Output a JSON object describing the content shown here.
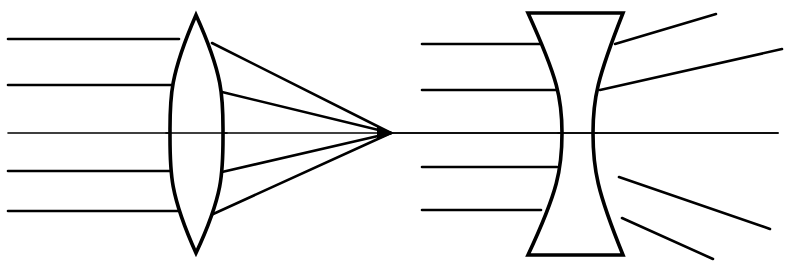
{
  "figure": {
    "width": 785,
    "height": 267,
    "background_color": "#ffffff",
    "stroke_color": "#000000",
    "lens_fill": "#ffffff"
  },
  "optical_axis": {
    "name": "optical-axis",
    "y": 133,
    "x_start": 8,
    "x_end": 778,
    "stroke_width": 1.6
  },
  "focal_point": {
    "name": "focal-point",
    "x": 391,
    "y": 133,
    "marker": "arrowhead-convergence"
  },
  "converging_lens": {
    "name": "biconvex-lens",
    "type": "biconvex",
    "top_vertex": {
      "x": 196,
      "y": 15
    },
    "bottom_vertex": {
      "x": 196,
      "y": 253
    },
    "left_bulge_x": 170,
    "right_bulge_x": 223,
    "axis_y": 133,
    "stroke_width": 3.6
  },
  "diverging_lens": {
    "name": "biconcave-lens",
    "type": "biconcave",
    "top_left": {
      "x": 528,
      "y": 13
    },
    "top_right": {
      "x": 623,
      "y": 13
    },
    "bottom_left": {
      "x": 528,
      "y": 255
    },
    "bottom_right": {
      "x": 623,
      "y": 255
    },
    "waist_left_x": 562,
    "waist_right_x": 593,
    "axis_y": 133,
    "stroke_width": 3.6
  },
  "incident_rays_left": {
    "name": "incident-parallel-rays-left",
    "count": 5,
    "x_start": 8,
    "stroke_width": 2.6,
    "rays": [
      {
        "label": "ray-1",
        "y": 39,
        "x_end": 179
      },
      {
        "label": "ray-2",
        "y": 85,
        "x_end": 172
      },
      {
        "label": "ray-3",
        "y": 133,
        "x_end": 170
      },
      {
        "label": "ray-4",
        "y": 171,
        "x_end": 172
      },
      {
        "label": "ray-5",
        "y": 211,
        "x_end": 178
      }
    ]
  },
  "refracted_rays_converging": {
    "name": "converging-refracted-rays",
    "count": 4,
    "converge_at": {
      "x": 391,
      "y": 133
    },
    "stroke_width": 2.6,
    "rays": [
      {
        "label": "conv-ray-1",
        "x_start": 212,
        "y_start": 43
      },
      {
        "label": "conv-ray-2",
        "x_start": 222,
        "y_start": 92
      },
      {
        "label": "conv-ray-3",
        "x_start": 222,
        "y_start": 172
      },
      {
        "label": "conv-ray-4",
        "x_start": 211,
        "y_start": 215
      }
    ]
  },
  "incident_rays_right": {
    "name": "incident-parallel-rays-right",
    "count": 5,
    "x_start": 422,
    "stroke_width": 2.6,
    "rays": [
      {
        "label": "ray-6",
        "y": 44,
        "x_end": 540
      },
      {
        "label": "ray-7",
        "y": 90,
        "x_end": 557
      },
      {
        "label": "ray-8",
        "y": 133,
        "x_end": 562
      },
      {
        "label": "ray-9",
        "y": 167,
        "x_end": 557
      },
      {
        "label": "ray-10",
        "y": 210,
        "x_end": 541
      }
    ]
  },
  "refracted_rays_diverging": {
    "name": "diverging-refracted-rays",
    "count": 4,
    "stroke_width": 2.6,
    "rays": [
      {
        "label": "div-ray-1",
        "x_start": 615,
        "y_start": 44,
        "x_end": 716,
        "y_end": 14
      },
      {
        "label": "div-ray-2",
        "x_start": 600,
        "y_start": 90,
        "x_end": 782,
        "y_end": 49
      },
      {
        "label": "div-ray-3",
        "x_start": 619,
        "y_start": 177,
        "x_end": 770,
        "y_end": 229
      },
      {
        "label": "div-ray-4",
        "x_start": 622,
        "y_start": 218,
        "x_end": 713,
        "y_end": 259
      }
    ]
  }
}
